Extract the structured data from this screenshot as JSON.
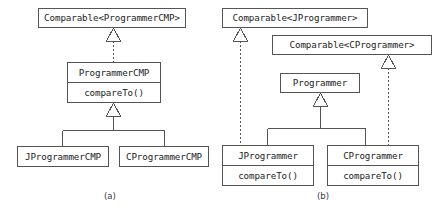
{
  "figure": {
    "kind": "uml-class-diagram",
    "background_color": "#ffffff",
    "line_color": "#545454",
    "text_color": "#1c1c1c",
    "panels": [
      {
        "id": "panel-a",
        "caption": "(a)",
        "classes": [
          {
            "id": "comparable-programmercmp",
            "name": "Comparable<ProgrammerCMP>",
            "members": [],
            "x": 38,
            "y": 8,
            "w": 148,
            "h": 20
          },
          {
            "id": "programmercmp",
            "name": "ProgrammerCMP",
            "members": [
              "compareTo()"
            ],
            "x": 67,
            "y": 62,
            "w": 94,
            "h": 41
          },
          {
            "id": "jprogrammercmp",
            "name": "JProgrammerCMP",
            "members": [],
            "x": 17,
            "y": 146,
            "w": 92,
            "h": 21
          },
          {
            "id": "cprogrammercmp",
            "name": "CProgrammerCMP",
            "members": [],
            "x": 119,
            "y": 146,
            "w": 90,
            "h": 21
          }
        ],
        "relations": [
          {
            "from": "programmercmp",
            "to": "comparable-programmercmp",
            "type": "realization",
            "style": "dotted"
          },
          {
            "from": "jprogrammercmp",
            "to": "programmercmp",
            "type": "generalization",
            "style": "solid"
          },
          {
            "from": "cprogrammercmp",
            "to": "programmercmp",
            "type": "generalization",
            "style": "solid"
          }
        ]
      },
      {
        "id": "panel-b",
        "caption": "(b)",
        "classes": [
          {
            "id": "comparable-jprogrammer",
            "name": "Comparable<JProgrammer>",
            "members": [],
            "x": 222,
            "y": 8,
            "w": 146,
            "h": 20
          },
          {
            "id": "comparable-cprogrammer",
            "name": "Comparable<CProgrammer>",
            "members": [],
            "x": 272,
            "y": 35,
            "w": 160,
            "h": 20
          },
          {
            "id": "programmer",
            "name": "Programmer",
            "members": [],
            "x": 280,
            "y": 73,
            "w": 80,
            "h": 20
          },
          {
            "id": "jprogrammer",
            "name": "JProgrammer",
            "members": [
              "compareTo()"
            ],
            "x": 222,
            "y": 145,
            "w": 92,
            "h": 41
          },
          {
            "id": "cprogrammer",
            "name": "CProgrammer",
            "members": [
              "compareTo()"
            ],
            "x": 327,
            "y": 145,
            "w": 92,
            "h": 41
          }
        ],
        "relations": [
          {
            "from": "jprogrammer",
            "to": "comparable-jprogrammer",
            "type": "realization",
            "style": "dotted"
          },
          {
            "from": "cprogrammer",
            "to": "comparable-cprogrammer",
            "type": "realization",
            "style": "dotted"
          },
          {
            "from": "jprogrammer",
            "to": "programmer",
            "type": "generalization",
            "style": "solid"
          },
          {
            "from": "cprogrammer",
            "to": "programmer",
            "type": "generalization",
            "style": "solid"
          }
        ]
      }
    ]
  }
}
